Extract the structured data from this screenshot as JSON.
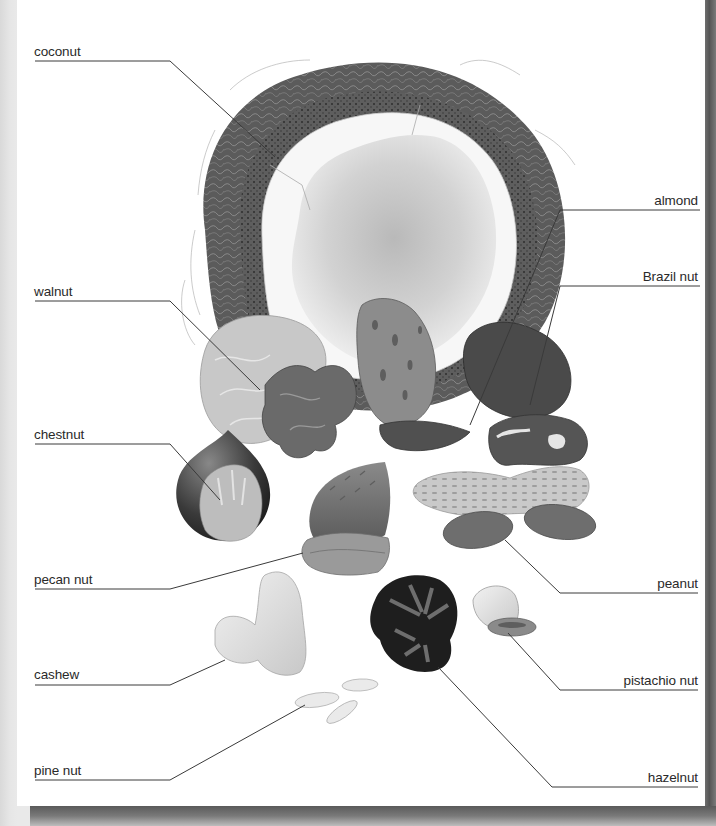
{
  "figure": {
    "labels": {
      "coconut": "coconut",
      "almond": "almond",
      "walnut": "walnut",
      "brazil_nut": "Brazil nut",
      "chestnut": "chestnut",
      "pecan_nut": "pecan nut",
      "peanut": "peanut",
      "cashew": "cashew",
      "pistachio_nut": "pistachio nut",
      "pine_nut": "pine nut",
      "hazelnut": "hazelnut"
    },
    "colors": {
      "page": "#ffffff",
      "backdrop": "#e8e8e8",
      "shadow": "#5a5a5a",
      "leader_line": "#3a3a3a",
      "label_text": "#2a2a2a"
    }
  }
}
